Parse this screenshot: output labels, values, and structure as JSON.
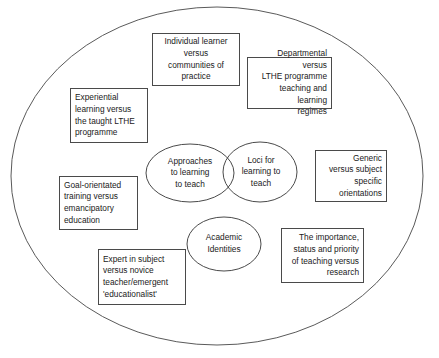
{
  "diagram": {
    "outer_boundary": {
      "shape": "ellipse",
      "label": ""
    },
    "core_nodes": [
      {
        "id": "approaches-to-learning-to-teach",
        "label": "Approaches\nto learning\nto teach",
        "shape": "ellipse"
      },
      {
        "id": "loci-for-learning-to-teach",
        "label": "Loci for\nlearning to\nteach",
        "shape": "ellipse"
      },
      {
        "id": "academic-identities",
        "label": "Academic\nIdentities",
        "shape": "ellipse"
      }
    ],
    "theme_boxes": [
      {
        "id": "individual-learner-versus-communities-of-practice",
        "label": "Individual learner\nversus\ncommunities of\npractice",
        "align": "center"
      },
      {
        "id": "departmental-versus-lthe-programme",
        "label": "Departmental versus\nLTHE programme\nteaching and learning\nregimes",
        "align": "right"
      },
      {
        "id": "experiential-learning-versus-taught-lthe",
        "label": "Experiential\nlearning versus\nthe taught LTHE\nprogramme",
        "align": "left"
      },
      {
        "id": "generic-versus-subject-specific-orientations",
        "label": "Generic\nversus subject\nspecific\norientations",
        "align": "right"
      },
      {
        "id": "goal-orientated-training-versus-emancipatory-education",
        "label": "Goal-orientated\ntraining versus\nemancipatory\neducation",
        "align": "left"
      },
      {
        "id": "importance-status-priority-of-teaching-versus-research",
        "label": "The importance,\nstatus and priority\nof teaching versus\nresearch",
        "align": "right"
      },
      {
        "id": "expert-in-subject-versus-novice-teacher",
        "label": "Expert in subject\nversus novice\nteacher/emergent\n'educationalist'",
        "align": "left"
      }
    ],
    "colors": {
      "stroke": "#4a4a4a",
      "text": "#1a1a1a",
      "background": "#ffffff"
    }
  }
}
